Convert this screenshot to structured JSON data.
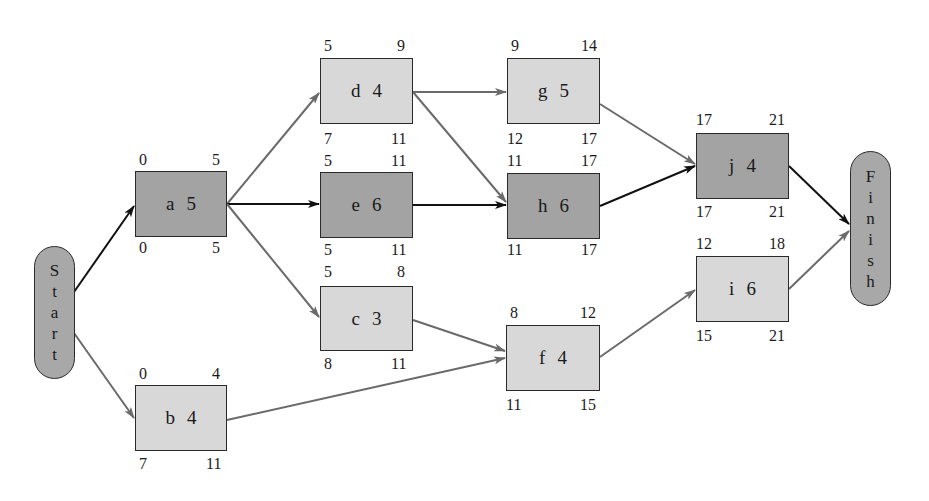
{
  "diagram": {
    "type": "network-diagram-critical-path",
    "colors": {
      "critical_fill": "#a3a3a3",
      "noncritical_fill": "#d8d8d8",
      "critical_arrow": "#111111",
      "noncritical_arrow": "#6a6a6a",
      "terminal_fill": "#a8a8a8"
    },
    "start": {
      "label": "Start",
      "letters": [
        "S",
        "t",
        "a",
        "r",
        "t"
      ]
    },
    "finish": {
      "label": "Finish",
      "letters": [
        "F",
        "i",
        "n",
        "i",
        "s",
        "h"
      ]
    },
    "nodes": {
      "a": {
        "activity": "a",
        "duration": "5",
        "es": "0",
        "ef": "5",
        "ls": "0",
        "lf": "5",
        "critical": true
      },
      "b": {
        "activity": "b",
        "duration": "4",
        "es": "0",
        "ef": "4",
        "ls": "7",
        "lf": "11",
        "critical": false
      },
      "c": {
        "activity": "c",
        "duration": "3",
        "es": "5",
        "ef": "8",
        "ls": "8",
        "lf": "11",
        "critical": false
      },
      "d": {
        "activity": "d",
        "duration": "4",
        "es": "5",
        "ef": "9",
        "ls": "7",
        "lf": "11",
        "critical": false
      },
      "e": {
        "activity": "e",
        "duration": "6",
        "es": "5",
        "ef": "11",
        "ls": "5",
        "lf": "11",
        "critical": true
      },
      "f": {
        "activity": "f",
        "duration": "4",
        "es": "8",
        "ef": "12",
        "ls": "11",
        "lf": "15",
        "critical": false
      },
      "g": {
        "activity": "g",
        "duration": "5",
        "es": "9",
        "ef": "14",
        "ls": "12",
        "lf": "17",
        "critical": false
      },
      "h": {
        "activity": "h",
        "duration": "6",
        "es": "11",
        "ef": "17",
        "ls": "11",
        "lf": "17",
        "critical": true
      },
      "i": {
        "activity": "i",
        "duration": "6",
        "es": "12",
        "ef": "18",
        "ls": "15",
        "lf": "21",
        "critical": false
      },
      "j": {
        "activity": "j",
        "duration": "4",
        "es": "17",
        "ef": "21",
        "ls": "17",
        "lf": "21",
        "critical": true
      }
    },
    "edges": [
      {
        "from": "Start",
        "to": "a",
        "critical": true
      },
      {
        "from": "Start",
        "to": "b",
        "critical": false
      },
      {
        "from": "a",
        "to": "d",
        "critical": false
      },
      {
        "from": "a",
        "to": "e",
        "critical": true
      },
      {
        "from": "a",
        "to": "c",
        "critical": false
      },
      {
        "from": "b",
        "to": "f",
        "critical": false
      },
      {
        "from": "c",
        "to": "f",
        "critical": false
      },
      {
        "from": "d",
        "to": "g",
        "critical": false
      },
      {
        "from": "d",
        "to": "h",
        "critical": false
      },
      {
        "from": "e",
        "to": "h",
        "critical": true
      },
      {
        "from": "g",
        "to": "j",
        "critical": false
      },
      {
        "from": "h",
        "to": "j",
        "critical": true
      },
      {
        "from": "f",
        "to": "i",
        "critical": false
      },
      {
        "from": "j",
        "to": "Finish",
        "critical": true
      },
      {
        "from": "i",
        "to": "Finish",
        "critical": false
      }
    ]
  }
}
